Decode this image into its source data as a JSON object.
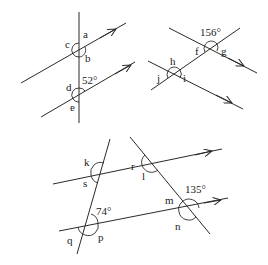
{
  "figures": [
    {
      "id": "figure-1",
      "labels": {
        "a": "a",
        "b": "b",
        "c": "c",
        "d": "d",
        "e": "e"
      },
      "given_angle": "52°"
    },
    {
      "id": "figure-2",
      "labels": {
        "f": "f",
        "g": "g",
        "h": "h",
        "i": "i",
        "j": "j"
      },
      "given_angle": "156°"
    },
    {
      "id": "figure-3",
      "labels": {
        "k": "k",
        "l": "l",
        "m": "m",
        "n": "n",
        "p": "p",
        "q": "q",
        "r": "r",
        "s": "s"
      },
      "given_angle_1": "74°",
      "given_angle_2": "135°"
    }
  ],
  "colors": {
    "stroke": "#2a2a2a",
    "background": "#ffffff"
  }
}
